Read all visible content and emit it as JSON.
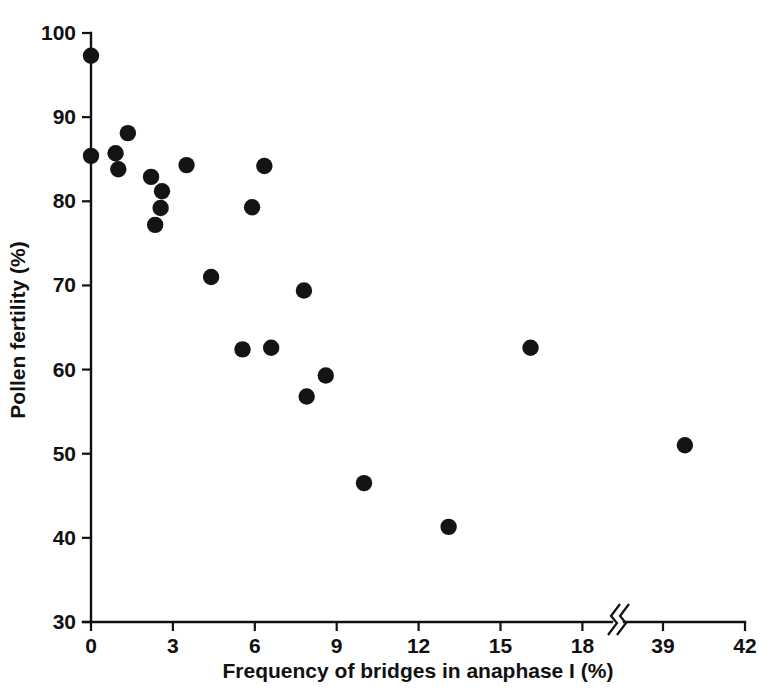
{
  "chart_data": {
    "type": "scatter",
    "title": "",
    "xlabel": "Frequency of bridges in anaphase I (%)",
    "ylabel": "Pollen fertility (%)",
    "xlim": [
      0,
      42
    ],
    "ylim": [
      30,
      100
    ],
    "grid": false,
    "legend": "none",
    "axis_break": {
      "present": true,
      "between": [
        18,
        39
      ],
      "style": "double-slash"
    },
    "xticks": [
      0,
      3,
      6,
      9,
      12,
      15,
      18,
      39,
      42
    ],
    "xtick_labels": [
      "0",
      "3",
      "6",
      "9",
      "12",
      "15",
      "18",
      "39",
      "42"
    ],
    "yticks": [
      30,
      40,
      50,
      60,
      70,
      80,
      90,
      100
    ],
    "ytick_labels": [
      "30",
      "40",
      "50",
      "60",
      "70",
      "80",
      "90",
      "100"
    ],
    "marker": "filled-circle",
    "marker_color": "#141414",
    "points": [
      {
        "x": 0.0,
        "y": 97.3
      },
      {
        "x": 0.0,
        "y": 85.4
      },
      {
        "x": 0.9,
        "y": 85.7
      },
      {
        "x": 1.0,
        "y": 83.8
      },
      {
        "x": 1.35,
        "y": 88.1
      },
      {
        "x": 2.2,
        "y": 82.9
      },
      {
        "x": 2.6,
        "y": 81.2
      },
      {
        "x": 2.55,
        "y": 79.2
      },
      {
        "x": 2.35,
        "y": 77.2
      },
      {
        "x": 3.5,
        "y": 84.3
      },
      {
        "x": 6.35,
        "y": 84.2
      },
      {
        "x": 5.9,
        "y": 79.3
      },
      {
        "x": 4.4,
        "y": 71.0
      },
      {
        "x": 7.8,
        "y": 69.4
      },
      {
        "x": 5.55,
        "y": 62.4
      },
      {
        "x": 6.6,
        "y": 62.6
      },
      {
        "x": 8.6,
        "y": 59.3
      },
      {
        "x": 7.9,
        "y": 56.8
      },
      {
        "x": 10.0,
        "y": 46.5
      },
      {
        "x": 13.1,
        "y": 41.3
      },
      {
        "x": 16.1,
        "y": 62.6
      },
      {
        "x": 39.8,
        "y": 51.0
      }
    ]
  }
}
